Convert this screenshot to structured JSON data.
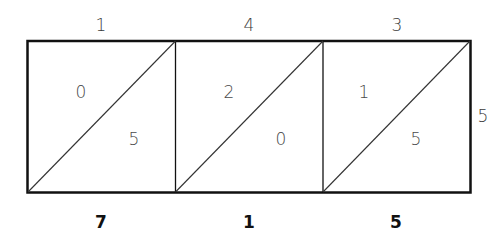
{
  "diagram": {
    "type": "lattice-multiplication",
    "top_digits": [
      "1",
      "4",
      "3"
    ],
    "right_digit": "5",
    "cells": [
      {
        "upper": "0",
        "lower": "5"
      },
      {
        "upper": "2",
        "lower": "0"
      },
      {
        "upper": "1",
        "lower": "5"
      }
    ],
    "result_digits": [
      "7",
      "1",
      "5"
    ],
    "colors": {
      "line": "#111111",
      "digit": "#4a4a4a",
      "result": "#111111"
    }
  }
}
